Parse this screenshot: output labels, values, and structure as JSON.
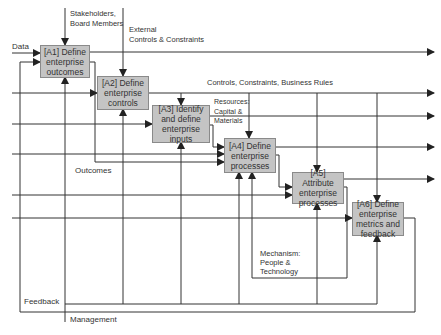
{
  "diagram": {
    "type": "IDEF0 process flow",
    "boxes": [
      {
        "id": "A1",
        "label": "[A1] Define enterprise outcomes"
      },
      {
        "id": "A2",
        "label": "[A2] Define enterprise controls"
      },
      {
        "id": "A3",
        "label": "[A3] Identify and define enterprise inputs"
      },
      {
        "id": "A4",
        "label": "[A4] Define enterprise processes"
      },
      {
        "id": "A5",
        "label": "[A5] Attribute enterprise processes"
      },
      {
        "id": "A6",
        "label": "[A6] Define enterprise metrics and feedback"
      }
    ],
    "labels": {
      "data": "Data",
      "stakeholders": "Stakeholders,\nBoard Members",
      "external_controls": "External\nControls & Constraints",
      "controls_rules": "Controls, Constraints, Business Rules",
      "resources": "Resources:\nCapital &\nMaterials",
      "outcomes": "Outcomes",
      "mechanism": "Mechanism:\nPeople &\nTechnology",
      "feedback": "Feedback",
      "management": "Management"
    },
    "colors": {
      "box_fill": "#c4c4c4",
      "box_border": "#8a8a8a",
      "line": "#333333"
    }
  }
}
